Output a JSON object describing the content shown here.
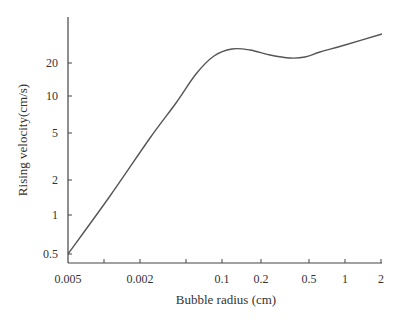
{
  "chart_data": {
    "type": "line",
    "title": "",
    "xlabel": "Bubble radius (cm)",
    "ylabel": "Rising velocity(cm/s)",
    "x_tick_labels": [
      "0.005",
      "0.002",
      "",
      "0.1",
      "0.2",
      "0.5",
      "1",
      "2"
    ],
    "y_tick_labels": [
      "0.5",
      "1",
      "2",
      "5",
      "10",
      "20"
    ],
    "xscale": "log",
    "yscale": "log",
    "grid": false,
    "legend": null,
    "series": [
      {
        "name": "Rising velocity",
        "x": [
          0.005,
          0.01,
          0.02,
          0.05,
          0.08,
          0.1,
          0.13,
          0.2,
          0.3,
          0.4,
          0.5,
          1,
          2
        ],
        "values": [
          0.5,
          1.0,
          2.2,
          9.0,
          18.0,
          23.0,
          25.0,
          23.5,
          22.0,
          22.2,
          23.5,
          28.5,
          36.0
        ]
      }
    ],
    "ylim": [
      0.45,
      60
    ],
    "xlim": [
      0.005,
      2
    ]
  },
  "axes": {
    "x_label": "Bubble radius (cm)",
    "y_label": "Rising velocity(cm/s)"
  },
  "layout": {
    "x_ticks_px": [
      68,
      104,
      140,
      186,
      222,
      261,
      309,
      345,
      381
    ],
    "x_tick_text": [
      "0.005",
      "",
      "0.002",
      "",
      "0.1",
      "0.2",
      "0.5",
      "1",
      "2"
    ],
    "y_ticks_px": [
      254,
      215,
      180,
      133,
      96,
      63
    ],
    "y_tick_text": [
      "0.5",
      "1",
      "2",
      "5",
      "10",
      "20"
    ],
    "curve_px": [
      [
        68,
        254
      ],
      [
        110,
        196
      ],
      [
        150,
        138
      ],
      [
        176,
        103
      ],
      [
        196,
        74
      ],
      [
        214,
        56
      ],
      [
        232,
        49
      ],
      [
        250,
        50
      ],
      [
        270,
        55
      ],
      [
        290,
        58
      ],
      [
        305,
        57
      ],
      [
        320,
        52
      ],
      [
        345,
        45
      ],
      [
        382,
        34
      ]
    ],
    "line_color": "#555555",
    "axis_color": "#444444"
  }
}
